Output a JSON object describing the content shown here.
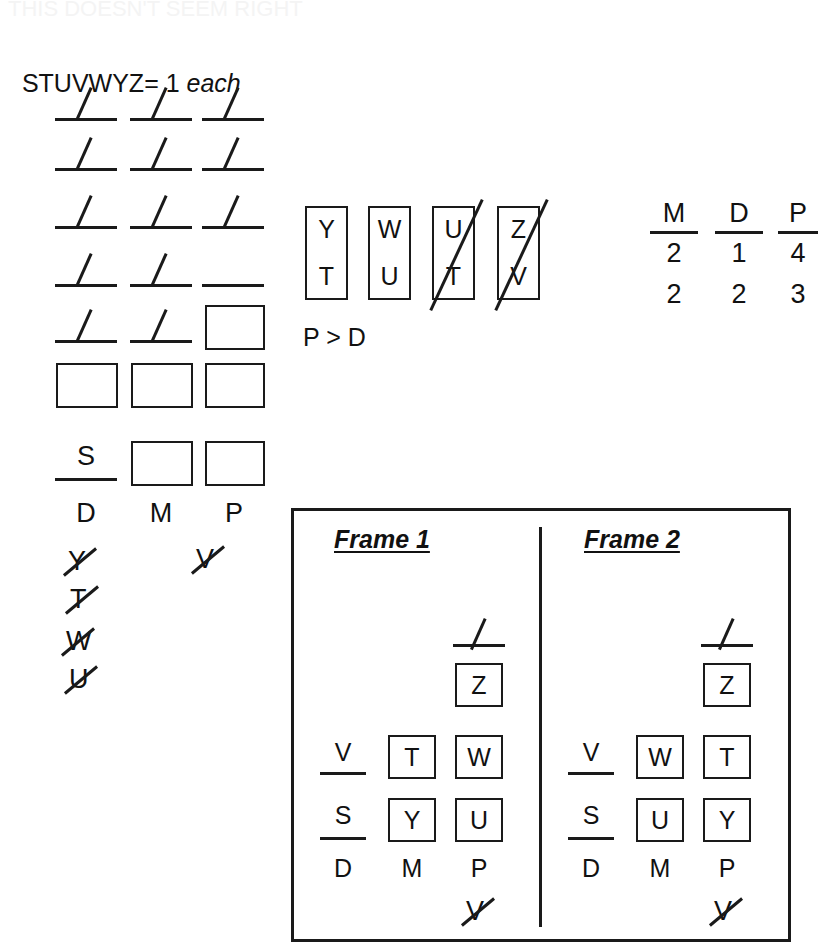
{
  "page": {
    "top_cut_text": "THIS DOESN'T SEEM RIGHT",
    "legend": {
      "letters": "STUVWYZ",
      "equals": "= 1 ",
      "each": "each"
    }
  },
  "left_grid": {
    "column_labels": [
      "D",
      "M",
      "P"
    ],
    "rows": [
      {
        "cells": [
          {
            "type": "blank",
            "mark": "slash"
          },
          {
            "type": "blank",
            "mark": "slash"
          },
          {
            "type": "blank",
            "mark": "slash"
          }
        ]
      },
      {
        "cells": [
          {
            "type": "blank",
            "mark": "slash"
          },
          {
            "type": "blank",
            "mark": "slash"
          },
          {
            "type": "blank",
            "mark": "slash"
          }
        ]
      },
      {
        "cells": [
          {
            "type": "blank",
            "mark": "slash"
          },
          {
            "type": "blank",
            "mark": "slash"
          },
          {
            "type": "blank",
            "mark": "slash"
          }
        ]
      },
      {
        "cells": [
          {
            "type": "blank",
            "mark": "slash"
          },
          {
            "type": "blank",
            "mark": "slash"
          },
          {
            "type": "blank",
            "mark": "none"
          }
        ]
      },
      {
        "cells": [
          {
            "type": "blank",
            "mark": "slash"
          },
          {
            "type": "blank",
            "mark": "slash"
          },
          {
            "type": "box",
            "value": ""
          }
        ]
      },
      {
        "cells": [
          {
            "type": "box",
            "value": ""
          },
          {
            "type": "box",
            "value": ""
          },
          {
            "type": "box",
            "value": ""
          }
        ]
      },
      {
        "cells": [
          {
            "type": "blank",
            "mark": "none",
            "value": "S"
          },
          {
            "type": "box",
            "value": ""
          },
          {
            "type": "box",
            "value": ""
          }
        ]
      }
    ],
    "eliminated": {
      "under_d": [
        "Y",
        "T",
        "W",
        "U"
      ],
      "under_p": [
        "V"
      ]
    }
  },
  "pair_boxes": {
    "items": [
      {
        "top": "Y",
        "bottom": "T",
        "struck": false
      },
      {
        "top": "W",
        "bottom": "U",
        "struck": false
      },
      {
        "top": "U",
        "bottom": "T",
        "struck": true
      },
      {
        "top": "Z",
        "bottom": "V",
        "struck": true
      }
    ],
    "note": "P > D"
  },
  "counts": {
    "columns": [
      {
        "label": "M",
        "v1": "2",
        "v2": "2"
      },
      {
        "label": "D",
        "v1": "1",
        "v2": "2"
      },
      {
        "label": "P",
        "v1": "4",
        "v2": "3"
      }
    ]
  },
  "frames": {
    "items": [
      {
        "title": "Frame 1",
        "column_labels": [
          "D",
          "M",
          "P"
        ],
        "p_top": {
          "type": "blank",
          "mark": "slash"
        },
        "rows": [
          {
            "d": {
              "type": "blank",
              "value": ""
            },
            "m": {
              "type": "none",
              "value": ""
            },
            "p": {
              "type": "box",
              "value": "Z"
            }
          },
          {
            "d": {
              "type": "blank",
              "value": "V"
            },
            "m": {
              "type": "box",
              "value": "T"
            },
            "p": {
              "type": "box",
              "value": "W"
            }
          },
          {
            "d": {
              "type": "blank",
              "value": "S"
            },
            "m": {
              "type": "box",
              "value": "Y"
            },
            "p": {
              "type": "box",
              "value": "U"
            }
          }
        ],
        "eliminated_under_p": "V"
      },
      {
        "title": "Frame 2",
        "column_labels": [
          "D",
          "M",
          "P"
        ],
        "p_top": {
          "type": "blank",
          "mark": "slash"
        },
        "rows": [
          {
            "d": {
              "type": "blank",
              "value": ""
            },
            "m": {
              "type": "none",
              "value": ""
            },
            "p": {
              "type": "box",
              "value": "Z"
            }
          },
          {
            "d": {
              "type": "blank",
              "value": "V"
            },
            "m": {
              "type": "box",
              "value": "W"
            },
            "p": {
              "type": "box",
              "value": "T"
            }
          },
          {
            "d": {
              "type": "blank",
              "value": "S"
            },
            "m": {
              "type": "box",
              "value": "U"
            },
            "p": {
              "type": "box",
              "value": "Y"
            }
          }
        ],
        "eliminated_under_p": "V"
      }
    ]
  },
  "colors": {
    "ink": "#1a1a1a",
    "paper": "#ffffff"
  }
}
